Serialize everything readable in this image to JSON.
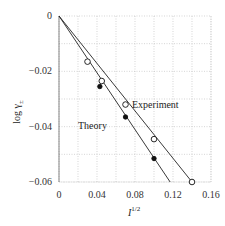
{
  "chart_data": {
    "type": "line",
    "title": "",
    "xlabel": "I^{1/2}",
    "ylabel": "log γ±",
    "xlim": [
      0,
      0.16
    ],
    "ylim": [
      -0.06,
      0
    ],
    "x_ticks": [
      "0",
      "0.04",
      "0.08",
      "0.12",
      "0.16"
    ],
    "y_ticks": [
      "0",
      "−0.02",
      "−0.04",
      "−0.06"
    ],
    "grid": true,
    "legend": "inline annotations",
    "series": [
      {
        "name": "Experiment",
        "marker": "open-circle",
        "line_points": [
          [
            0,
            0
          ],
          [
            0.14,
            -0.06
          ]
        ],
        "points": [
          [
            0.03,
            -0.0165
          ],
          [
            0.045,
            -0.0235
          ],
          [
            0.07,
            -0.032
          ],
          [
            0.1,
            -0.0445
          ],
          [
            0.14,
            -0.06
          ]
        ]
      },
      {
        "name": "Theory",
        "marker": "filled-circle",
        "line_points": [
          [
            0,
            0
          ],
          [
            0.117,
            -0.06
          ]
        ],
        "points": [
          [
            0.043,
            -0.0255
          ],
          [
            0.07,
            -0.0365
          ],
          [
            0.1,
            -0.0515
          ]
        ]
      }
    ],
    "annotations": [
      {
        "text": "Experiment",
        "x": 0.1,
        "y": -0.034
      },
      {
        "text": "Theory",
        "x": 0.036,
        "y": -0.0395
      }
    ]
  },
  "labels": {
    "experiment": "Experiment",
    "theory": "Theory",
    "xlabel_base": "I",
    "xlabel_sup": "1/2",
    "ylabel_base": "log γ",
    "ylabel_sub": "±"
  },
  "ticks": {
    "x": [
      "0",
      "0.04",
      "0.08",
      "0.12",
      "0.16"
    ],
    "y": [
      "0",
      "−0.02",
      "−0.04",
      "−0.06"
    ]
  }
}
